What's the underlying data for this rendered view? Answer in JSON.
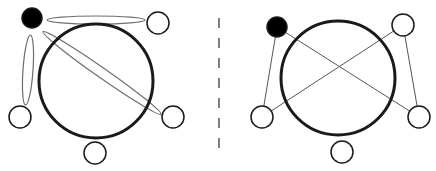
{
  "colors": {
    "background": "#ffffff",
    "stroke": "#1a1a1a",
    "thin_stroke": "#555555",
    "ellipse_stroke": "#6e6e6e",
    "filled_node": "#000000",
    "divider": "#555555"
  },
  "panels": [
    {
      "name": "left-panel",
      "big_circle": {
        "cx": 96,
        "cy": 81,
        "r": 57
      },
      "nodes": [
        {
          "id": "filled",
          "cx": 32,
          "cy": 18,
          "r": 10,
          "filled": true
        },
        {
          "id": "top-right",
          "cx": 158,
          "cy": 23,
          "r": 11,
          "filled": false
        },
        {
          "id": "bottom-left",
          "cx": 20,
          "cy": 117,
          "r": 11,
          "filled": false
        },
        {
          "id": "bottom-right",
          "cx": 173,
          "cy": 117,
          "r": 11,
          "filled": false
        },
        {
          "id": "bottom",
          "cx": 95,
          "cy": 153,
          "r": 11,
          "filled": false
        }
      ],
      "ellipses": [
        {
          "id": "filled-to-top-right",
          "cx": 96,
          "cy": 20,
          "rx": 49,
          "ry": 4,
          "rotate": 0
        },
        {
          "id": "filled-to-bottom-left",
          "cx": 28,
          "cy": 70,
          "rx": 35,
          "ry": 5,
          "rotate": 94
        },
        {
          "id": "filled-to-bottom-right",
          "cx": 102,
          "cy": 73,
          "rx": 72,
          "ry": 5,
          "rotate": 35
        }
      ]
    },
    {
      "name": "right-panel",
      "big_circle": {
        "cx": 338,
        "cy": 78,
        "r": 57
      },
      "nodes": [
        {
          "id": "filled",
          "cx": 277,
          "cy": 27,
          "r": 10,
          "filled": true
        },
        {
          "id": "top-right",
          "cx": 403,
          "cy": 25,
          "r": 11,
          "filled": false
        },
        {
          "id": "bottom-left",
          "cx": 262,
          "cy": 117,
          "r": 11,
          "filled": false
        },
        {
          "id": "bottom-right",
          "cx": 419,
          "cy": 117,
          "r": 11,
          "filled": false
        },
        {
          "id": "bottom",
          "cx": 342,
          "cy": 152,
          "r": 11,
          "filled": false
        }
      ],
      "lines": [
        {
          "from": "filled",
          "to": "bottom-left"
        },
        {
          "from": "filled",
          "to": "bottom-right"
        },
        {
          "from": "top-right",
          "to": "bottom-left"
        },
        {
          "from": "top-right",
          "to": "bottom-right"
        }
      ]
    }
  ],
  "divider": {
    "x": 219,
    "y1": 18,
    "y2": 158,
    "dash": "10,10"
  }
}
